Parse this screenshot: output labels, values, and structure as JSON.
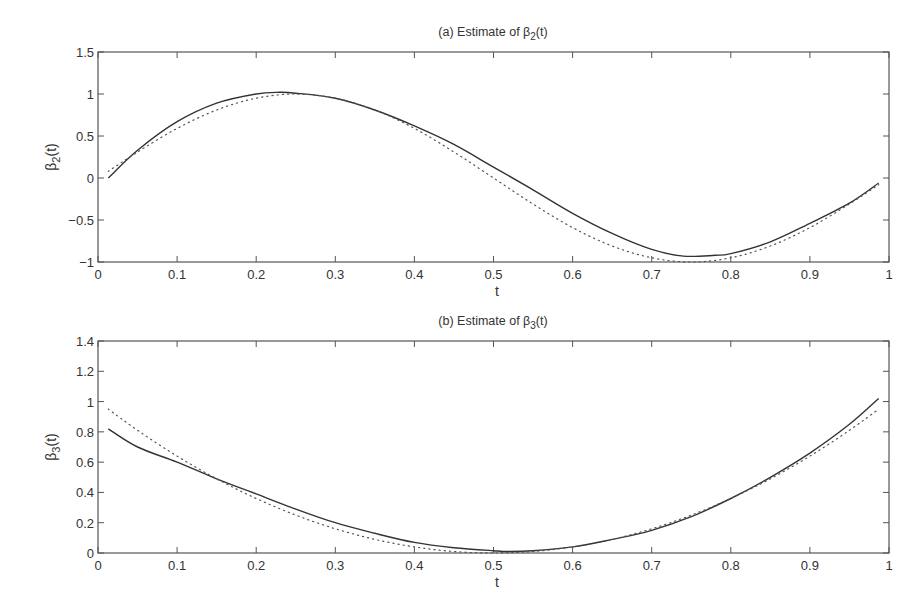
{
  "chart_data": [
    {
      "type": "line",
      "title": "(a) Estimate of β2(t)",
      "title_parts": {
        "prefix": "(a) Estimate of ",
        "symbol": "β",
        "sub": "2",
        "suffix": "(t)"
      },
      "xlabel": "t",
      "ylabel": "β2(t)",
      "ylabel_parts": {
        "symbol": "β",
        "sub": "2",
        "suffix": "(t)"
      },
      "xlim": [
        0,
        1
      ],
      "ylim": [
        -1,
        1.5
      ],
      "xticks": [
        "0",
        "0.1",
        "0.2",
        "0.3",
        "0.4",
        "0.5",
        "0.6",
        "0.7",
        "0.8",
        "0.9",
        "1"
      ],
      "yticks": [
        "−1",
        "−0.5",
        "0",
        "0.5",
        "1",
        "1.5"
      ],
      "ytick_values": [
        -1,
        -0.5,
        0,
        0.5,
        1,
        1.5
      ],
      "grid": false,
      "legend": null,
      "series": [
        {
          "name": "estimate",
          "style": "solid",
          "x": [
            0.013,
            0.05,
            0.1,
            0.15,
            0.2,
            0.23,
            0.25,
            0.3,
            0.35,
            0.4,
            0.45,
            0.5,
            0.55,
            0.6,
            0.65,
            0.7,
            0.74,
            0.78,
            0.8,
            0.85,
            0.9,
            0.95,
            0.987
          ],
          "y": [
            0.0,
            0.33,
            0.67,
            0.89,
            1.0,
            1.02,
            1.01,
            0.95,
            0.81,
            0.62,
            0.4,
            0.13,
            -0.14,
            -0.42,
            -0.66,
            -0.85,
            -0.93,
            -0.92,
            -0.9,
            -0.76,
            -0.54,
            -0.3,
            -0.06
          ]
        },
        {
          "name": "true",
          "style": "dotted",
          "x": [
            0.013,
            0.05,
            0.1,
            0.15,
            0.2,
            0.25,
            0.3,
            0.35,
            0.4,
            0.45,
            0.5,
            0.55,
            0.6,
            0.65,
            0.7,
            0.75,
            0.8,
            0.85,
            0.9,
            0.95,
            0.987
          ],
          "y": [
            0.08,
            0.31,
            0.59,
            0.81,
            0.95,
            1.0,
            0.95,
            0.81,
            0.59,
            0.31,
            0.0,
            -0.31,
            -0.59,
            -0.81,
            -0.95,
            -1.0,
            -0.95,
            -0.81,
            -0.59,
            -0.31,
            -0.08
          ]
        }
      ]
    },
    {
      "type": "line",
      "title": "(b) Estimate of β3(t)",
      "title_parts": {
        "prefix": "(b) Estimate of ",
        "symbol": "β",
        "sub": "3",
        "suffix": "(t)"
      },
      "xlabel": "t",
      "ylabel": "β3(t)",
      "ylabel_parts": {
        "symbol": "β",
        "sub": "3",
        "suffix": "(t)"
      },
      "xlim": [
        0,
        1
      ],
      "ylim": [
        0,
        1.4
      ],
      "xticks": [
        "0",
        "0.1",
        "0.2",
        "0.3",
        "0.4",
        "0.5",
        "0.6",
        "0.7",
        "0.8",
        "0.9",
        "1"
      ],
      "yticks": [
        "0",
        "0.2",
        "0.4",
        "0.6",
        "0.8",
        "1",
        "1.2",
        "1.4"
      ],
      "ytick_values": [
        0,
        0.2,
        0.4,
        0.6,
        0.8,
        1,
        1.2,
        1.4
      ],
      "grid": false,
      "legend": null,
      "series": [
        {
          "name": "estimate",
          "style": "solid",
          "x": [
            0.013,
            0.05,
            0.1,
            0.15,
            0.2,
            0.25,
            0.3,
            0.35,
            0.4,
            0.45,
            0.5,
            0.52,
            0.55,
            0.6,
            0.65,
            0.7,
            0.75,
            0.8,
            0.85,
            0.9,
            0.95,
            0.987
          ],
          "y": [
            0.82,
            0.7,
            0.6,
            0.49,
            0.39,
            0.29,
            0.2,
            0.13,
            0.07,
            0.035,
            0.015,
            0.01,
            0.015,
            0.04,
            0.09,
            0.15,
            0.24,
            0.36,
            0.5,
            0.66,
            0.85,
            1.02
          ]
        },
        {
          "name": "true",
          "style": "dotted",
          "x": [
            0.013,
            0.05,
            0.1,
            0.15,
            0.2,
            0.25,
            0.3,
            0.35,
            0.4,
            0.45,
            0.5,
            0.55,
            0.6,
            0.65,
            0.7,
            0.75,
            0.8,
            0.85,
            0.9,
            0.95,
            0.987
          ],
          "y": [
            0.95,
            0.81,
            0.64,
            0.49,
            0.36,
            0.25,
            0.16,
            0.09,
            0.04,
            0.01,
            0.0,
            0.01,
            0.04,
            0.09,
            0.16,
            0.25,
            0.36,
            0.49,
            0.64,
            0.81,
            0.95
          ]
        }
      ]
    }
  ],
  "panels": [
    {
      "title_prefix": "(a) Estimate of ",
      "title_symbol": "β",
      "title_sub": "2",
      "title_suffix": "(t)",
      "xlabel": "t",
      "ylabel_symbol": "β",
      "ylabel_sub": "2",
      "ylabel_suffix": "(t)"
    },
    {
      "title_prefix": "(b) Estimate of ",
      "title_symbol": "β",
      "title_sub": "3",
      "title_suffix": "(t)",
      "xlabel": "t",
      "ylabel_symbol": "β",
      "ylabel_sub": "3",
      "ylabel_suffix": "(t)"
    }
  ],
  "colors": {
    "axis": "#555555",
    "solid_line": "#333333",
    "dotted_line": "#555555",
    "text": "#333333"
  }
}
